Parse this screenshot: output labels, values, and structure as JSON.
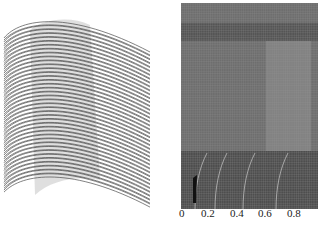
{
  "figure": {
    "left_panel": {
      "description": "stacked blade section curves (3D blade wireframe)",
      "curve_count": 40,
      "stroke_color": "#4a4a4a"
    },
    "right_panel": {
      "description": "computational mesh",
      "background_color": "#6e6e6e",
      "grid_line_color": "#9a9a9a",
      "x_ticks": [
        "0",
        "0.2",
        "0.4",
        "0.6",
        "0.8"
      ]
    }
  }
}
